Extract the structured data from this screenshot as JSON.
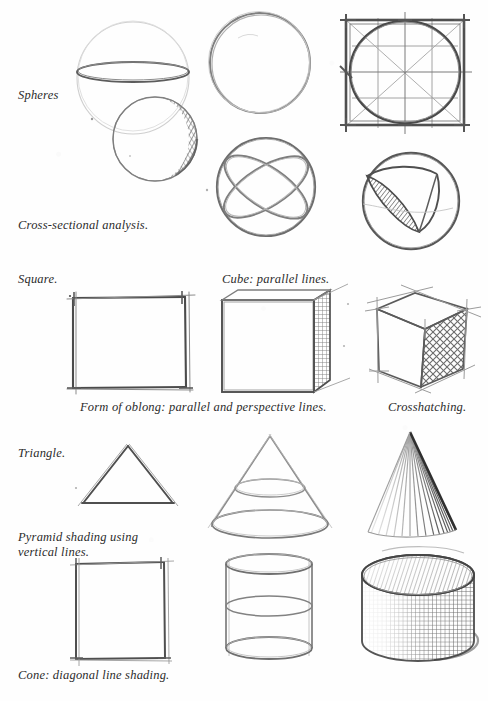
{
  "page": {
    "medium": "pencil sketch",
    "background_color": "#fefefe",
    "ink_color": "#3a3a3a",
    "text_color": "#2b2b2b",
    "width": 488,
    "height": 701
  },
  "captions": [
    {
      "id": "spheres",
      "text": "Spheres",
      "x": 18,
      "y": 88
    },
    {
      "id": "cross-section",
      "text": "Cross-sectional analysis.",
      "x": 18,
      "y": 218
    },
    {
      "id": "square",
      "text": "Square.",
      "x": 18,
      "y": 272
    },
    {
      "id": "cube-parallel",
      "text": "Cube: parallel lines.",
      "x": 222,
      "y": 272
    },
    {
      "id": "form-oblong",
      "text": "Form of oblong: parallel and perspective lines.",
      "x": 80,
      "y": 400
    },
    {
      "id": "crosshatching",
      "text": "Crosshatching.",
      "x": 388,
      "y": 400
    },
    {
      "id": "triangle",
      "text": "Triangle.",
      "x": 18,
      "y": 446
    },
    {
      "id": "pyramid-shading",
      "text": "Pyramid shading using\nvertical lines.",
      "x": 18,
      "y": 530
    },
    {
      "id": "cone-diagonal",
      "text": "Cone: diagonal line shading.",
      "x": 18,
      "y": 668
    }
  ],
  "figures": [
    {
      "id": "sphere-with-equator",
      "name": "Sphere with equator ellipse and shaded sphere",
      "row": 1,
      "column": 1,
      "description": "Light construction circle crossed by a horizontal ellipse, with a second overlapping sphere below right crosshatched on its shadow side."
    },
    {
      "id": "plain-circle",
      "name": "Plain freehand circle",
      "row": 1,
      "column": 2,
      "description": "Single sketched outline circle with no construction lines."
    },
    {
      "id": "square-with-inscribed-circle",
      "name": "Square with inscribed circle construction",
      "row": 1,
      "column": 3,
      "description": "Ruled square containing an inscribed circle, diagonals, centre cross and tick marks."
    },
    {
      "id": "sphere-great-circles",
      "name": "Sphere with crossing great circles",
      "row": 2,
      "column": 2,
      "description": "Outline sphere with two crossing elliptical section rings showing the axes."
    },
    {
      "id": "sphere-wedge-cut",
      "name": "Sphere with wedge section removed",
      "row": 2,
      "column": 3,
      "description": "Sphere with a wedge segment cut away exposing a hatched cross-section face."
    },
    {
      "id": "flat-square",
      "name": "Flat square",
      "row": 3,
      "column": 1,
      "description": "Pencil-ruled flat square with overshooting corner strokes."
    },
    {
      "id": "cube-parallel-projection",
      "name": "Cube in parallel projection with hatched side",
      "row": 3,
      "column": 2,
      "description": "Cube drawn with parallel receding lines, right-hand face filled with fine grid hatching."
    },
    {
      "id": "cube-perspective-crosshatch",
      "name": "Cube in perspective with crosshatched face",
      "row": 3,
      "column": 3,
      "description": "Cube drawn in perspective with construction overshoots and a diamond crosshatched right face."
    },
    {
      "id": "triangle-outline",
      "name": "Triangle outline",
      "row": 4,
      "column": 1,
      "description": "Simple isosceles triangle drawn with two strokes."
    },
    {
      "id": "cone-wireframe",
      "name": "Cone wireframe with section ellipses",
      "row": 4,
      "column": 2,
      "description": "Cone outline with two elliptical horizontal cross-sections and a full base ellipse."
    },
    {
      "id": "cone-shaded",
      "name": "Cone shaded with diagonal lines",
      "row": 4,
      "column": 3,
      "description": "Cone solidly shaded with radiating diagonal strokes, darkest along the right edge."
    },
    {
      "id": "rectangle-outline",
      "name": "Rectangle outline",
      "row": 5,
      "column": 1,
      "description": "Pencil-ruled upright rectangle with overshooting corners."
    },
    {
      "id": "cylinder-wireframe",
      "name": "Cylinder wireframe with section ellipses",
      "row": 5,
      "column": 2,
      "description": "Cylinder outline with top, middle and bottom elliptical sections."
    },
    {
      "id": "cylinder-shaded",
      "name": "Cylinder shaded with crosshatching",
      "row": 5,
      "column": 3,
      "description": "Solid cylinder with shaded elliptical top and crosshatched curved side."
    }
  ]
}
